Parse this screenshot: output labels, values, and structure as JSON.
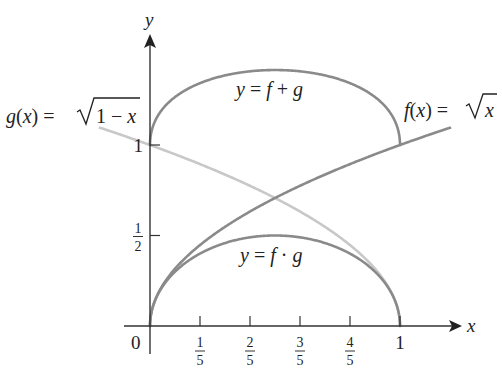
{
  "chart_data": {
    "type": "line",
    "title": "",
    "xlabel": "x",
    "ylabel": "y",
    "xlim": [
      -0.2,
      1.2
    ],
    "ylim": [
      0,
      1.6
    ],
    "grid": false,
    "origin_label": "0",
    "x_ticks": [
      {
        "value": 0.2,
        "num": "1",
        "den": "5"
      },
      {
        "value": 0.4,
        "num": "2",
        "den": "5"
      },
      {
        "value": 0.6,
        "num": "3",
        "den": "5"
      },
      {
        "value": 0.8,
        "num": "4",
        "den": "5"
      },
      {
        "value": 1.0,
        "label": "1"
      }
    ],
    "y_ticks": [
      {
        "value": 0.5,
        "num": "1",
        "den": "2"
      },
      {
        "value": 1.0,
        "label": "1"
      }
    ],
    "series": [
      {
        "name": "f(x) = √x",
        "expr": "sqrt(x)",
        "domain": [
          0,
          1.2
        ],
        "color": "#8a8a8a",
        "x": [
          0,
          0.2,
          0.4,
          0.6,
          0.8,
          1.0,
          1.2
        ],
        "y": [
          0,
          0.447,
          0.632,
          0.775,
          0.894,
          1.0,
          1.095
        ]
      },
      {
        "name": "g(x) = √(1 − x)",
        "expr": "sqrt(1-x)",
        "domain": [
          -0.2,
          1
        ],
        "color": "#c8c8c8",
        "x": [
          -0.2,
          0,
          0.2,
          0.4,
          0.6,
          0.8,
          1.0
        ],
        "y": [
          1.095,
          1.0,
          0.894,
          0.775,
          0.632,
          0.447,
          0
        ]
      },
      {
        "name": "y = f + g",
        "expr": "sqrt(x)+sqrt(1-x)",
        "domain": [
          0,
          1
        ],
        "color": "#8a8a8a",
        "x": [
          0,
          0.2,
          0.4,
          0.5,
          0.6,
          0.8,
          1.0
        ],
        "y": [
          1.0,
          1.342,
          1.407,
          1.414,
          1.407,
          1.342,
          1.0
        ]
      },
      {
        "name": "y = f · g",
        "expr": "sqrt(x)*sqrt(1-x)",
        "domain": [
          0,
          1
        ],
        "color": "#8a8a8a",
        "x": [
          0,
          0.2,
          0.4,
          0.5,
          0.6,
          0.8,
          1.0
        ],
        "y": [
          0,
          0.4,
          0.49,
          0.5,
          0.49,
          0.4,
          0
        ]
      }
    ],
    "annotations": [
      {
        "id": "g",
        "text_pre": "g(x) = ",
        "text_rad": "1 − x"
      },
      {
        "id": "f",
        "text_pre": "f(x) = ",
        "text_rad": "x"
      },
      {
        "id": "sum",
        "text": "y = f + g"
      },
      {
        "id": "prod",
        "text": "y = f · g"
      }
    ]
  }
}
